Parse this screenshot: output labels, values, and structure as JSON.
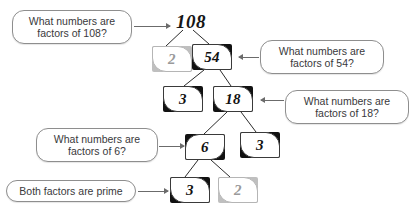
{
  "diagram": {
    "background_color": "#ffffff",
    "root": {
      "value": "108",
      "x": 176,
      "y": 12
    },
    "nodes": [
      {
        "id": "n-2a",
        "value": "2",
        "x": 152,
        "y": 46,
        "muted": true,
        "curl": "curl-tr-bl"
      },
      {
        "id": "n-54",
        "value": "54",
        "x": 192,
        "y": 44,
        "muted": false,
        "curl": "curl-tr-bl"
      },
      {
        "id": "n-3a",
        "value": "3",
        "x": 163,
        "y": 86,
        "muted": false,
        "curl": "curl-tr-bl"
      },
      {
        "id": "n-18",
        "value": "18",
        "x": 213,
        "y": 86,
        "muted": false,
        "curl": "curl-tr-bl"
      },
      {
        "id": "n-6",
        "value": "6",
        "x": 185,
        "y": 134,
        "muted": false,
        "curl": "curl-tl-br"
      },
      {
        "id": "n-3b",
        "value": "3",
        "x": 240,
        "y": 132,
        "muted": false,
        "curl": "curl-tr-bl"
      },
      {
        "id": "n-3c",
        "value": "3",
        "x": 170,
        "y": 177,
        "muted": false,
        "curl": "curl-tr-bl"
      },
      {
        "id": "n-2b",
        "value": "2",
        "x": 218,
        "y": 177,
        "muted": true,
        "curl": "curl-tr-bl"
      }
    ],
    "callouts": [
      {
        "id": "c-108",
        "line1": "What numbers are",
        "line2": "factors of 108?",
        "x": 12,
        "y": 10,
        "w": 120,
        "h": 34,
        "arrow": {
          "x": 134,
          "y": 26,
          "w": 36,
          "dir": "right"
        }
      },
      {
        "id": "c-54",
        "line1": "What numbers are",
        "line2": "factors of 54?",
        "x": 260,
        "y": 40,
        "w": 124,
        "h": 34,
        "arrow": {
          "x": 239,
          "y": 57,
          "w": 20,
          "dir": "left"
        }
      },
      {
        "id": "c-18",
        "line1": "What numbers are",
        "line2": "factors of 18?",
        "x": 285,
        "y": 90,
        "w": 124,
        "h": 34,
        "arrow": {
          "x": 261,
          "y": 100,
          "w": 23,
          "dir": "left"
        }
      },
      {
        "id": "c-6",
        "line1": "What numbers are",
        "line2": "factors of 6?",
        "x": 36,
        "y": 128,
        "w": 122,
        "h": 34,
        "arrow": {
          "x": 159,
          "y": 146,
          "w": 25,
          "dir": "right"
        }
      },
      {
        "id": "c-prime",
        "line1": "Both factors are prime",
        "line2": "",
        "x": 6,
        "y": 180,
        "w": 130,
        "h": 22,
        "arrow": {
          "x": 138,
          "y": 191,
          "w": 30,
          "dir": "right"
        }
      }
    ],
    "edges": [
      {
        "from": "108",
        "to": "2",
        "x1": 183,
        "y1": 30,
        "x2": 166,
        "y2": 46
      },
      {
        "from": "108",
        "to": "54",
        "x1": 193,
        "y1": 30,
        "x2": 209,
        "y2": 44
      },
      {
        "from": "54",
        "to": "3",
        "x1": 204,
        "y1": 70,
        "x2": 184,
        "y2": 86
      },
      {
        "from": "54",
        "to": "18",
        "x1": 220,
        "y1": 70,
        "x2": 231,
        "y2": 86
      },
      {
        "from": "18",
        "to": "6",
        "x1": 227,
        "y1": 112,
        "x2": 204,
        "y2": 134
      },
      {
        "from": "18",
        "to": "3",
        "x1": 241,
        "y1": 112,
        "x2": 256,
        "y2": 132
      },
      {
        "from": "6",
        "to": "3",
        "x1": 198,
        "y1": 160,
        "x2": 185,
        "y2": 177
      },
      {
        "from": "6",
        "to": "2",
        "x1": 211,
        "y1": 160,
        "x2": 230,
        "y2": 177
      }
    ]
  }
}
